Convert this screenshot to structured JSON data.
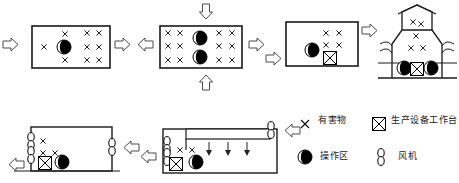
{
  "diagram": {
    "type": "industrial-ventilation-progression",
    "row_top": {
      "panels": [
        {
          "id": "panel-1",
          "name": "room-single-operator",
          "description": "房间内单个操作区，有害物扩散",
          "operator_zones": 1,
          "workbenches": 0,
          "hazard_marks": 9,
          "inflow_arrows": [
            "left"
          ],
          "outflow_arrows": [
            "right"
          ]
        },
        {
          "id": "panel-2",
          "name": "room-two-operators-vertical-flow",
          "description": "上下送风，两个操作区",
          "operator_zones": 2,
          "workbenches": 0,
          "hazard_marks": 12,
          "inflow_arrows": [
            "left",
            "top",
            "bottom"
          ],
          "outflow_arrows": [
            "right"
          ]
        },
        {
          "id": "panel-3",
          "name": "room-with-workbench",
          "description": "含生产设备工作台的房间",
          "operator_zones": 1,
          "workbenches": 1,
          "hazard_marks": 4,
          "inflow_arrows": [
            "left"
          ],
          "outflow_arrows": [
            "right"
          ]
        },
        {
          "id": "panel-4",
          "name": "factory-building-section",
          "description": "厂房剖面，自然通风天窗",
          "operator_zones": 2,
          "workbenches": 1,
          "hazard_marks": 5,
          "inflow_arrows": [
            "left",
            "right"
          ],
          "outflow_arrows": [
            "roof"
          ]
        }
      ]
    },
    "row_bottom": {
      "panels": [
        {
          "id": "panel-5",
          "name": "room-cross-ventilation-fans",
          "description": "两侧风机横向通风",
          "operator_zones": 1,
          "workbenches": 1,
          "hazard_marks": 4,
          "fans": [
            "left-wall",
            "right-wall"
          ],
          "inflow_arrows": [
            "right"
          ],
          "outflow_arrows": [
            "left"
          ]
        },
        {
          "id": "panel-6",
          "name": "room-ceiling-supply-duct",
          "description": "顶部送风管道下吹，侧墙排风机",
          "operator_zones": 1,
          "workbenches": 1,
          "hazard_marks": 2,
          "duct_arrows": 3,
          "fans": [
            "left-wall",
            "right-top"
          ],
          "inflow_arrows": [
            "right"
          ],
          "outflow_arrows": [
            "left"
          ]
        }
      ]
    }
  },
  "legend": {
    "title": "图例",
    "items": [
      {
        "symbol": "x-mark",
        "icon": "×",
        "label": "有害物"
      },
      {
        "symbol": "crossed-box",
        "icon": "⊠",
        "label": "生产设备工作台"
      },
      {
        "symbol": "half-circle",
        "icon": "◑",
        "label": "操作区"
      },
      {
        "symbol": "fan-ellipses",
        "icon": "θ",
        "label": "风机"
      }
    ]
  },
  "colors": {
    "stroke": "#1a1a1a",
    "fill": "#000000",
    "background": "#ffffff",
    "arrow_stroke": "#555555"
  }
}
